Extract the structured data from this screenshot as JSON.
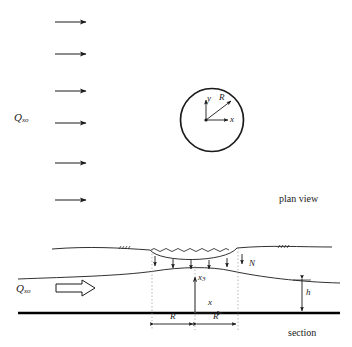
{
  "figure": {
    "type": "hydrogeology-schematic"
  },
  "plan_view": {
    "view_label": "plan view",
    "flow_label_base": "Q",
    "flow_label_sub": "xo",
    "flow_arrow_count": 6,
    "basin": {
      "shape": "circle",
      "radius_label": "R",
      "axis_x_label": "x",
      "axis_y_label": "y"
    }
  },
  "section_view": {
    "view_label": "section",
    "flow_label_base": "Q",
    "flow_label_sub": "xo",
    "recharge_label": "N",
    "recharge_arrow_count": 6,
    "thickness_label": "h",
    "axis_vertical_base": "x",
    "axis_vertical_sub": "3",
    "axis_horizontal_label": "x",
    "half_width_labels": [
      "R",
      "R"
    ]
  },
  "colors": {
    "ink": "#1a1a1a",
    "base": "#000000",
    "background": "#ffffff",
    "guide": "#9a9a9a"
  }
}
